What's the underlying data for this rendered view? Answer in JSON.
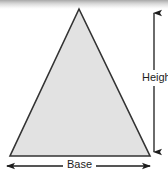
{
  "figure": {
    "type": "geometry-diagram",
    "shape": "triangle",
    "labels": {
      "height": "Height",
      "base": "Base"
    },
    "colors": {
      "triangle_fill": "#e2e2e2",
      "triangle_stroke": "#333333",
      "dimension_line": "#1d1d1d",
      "background": "#ffffff",
      "top_shadow": "#a8a8a8"
    },
    "geometry": {
      "apex": [
        79,
        9
      ],
      "bottom_left": [
        10,
        156
      ],
      "bottom_right": [
        150,
        156
      ],
      "height_line_x": 154,
      "height_line_top_y": 8,
      "height_line_bottom_y": 157,
      "base_line_y": 166,
      "base_line_left_x": 5,
      "base_line_right_x": 152
    }
  }
}
